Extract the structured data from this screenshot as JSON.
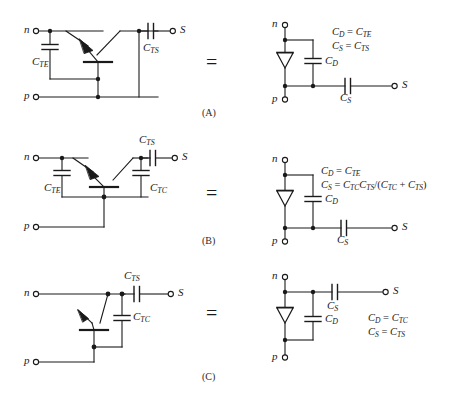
{
  "figure": {
    "background": "#ffffff",
    "ink": "#1a1a1a",
    "equals_sign": "=",
    "panels": [
      {
        "id": "A",
        "panel_label": "(A)",
        "left_circuit": {
          "terminals": [
            {
              "name": "n",
              "label": "n"
            },
            {
              "name": "p",
              "label": "p"
            },
            {
              "name": "S",
              "label": "S"
            }
          ],
          "capacitors": [
            {
              "name": "C_TE",
              "base": "C",
              "sub": "TE"
            },
            {
              "name": "C_TS",
              "base": "C",
              "sub": "TS"
            }
          ],
          "device": "bipolar-transistor"
        },
        "right_circuit": {
          "terminals": [
            {
              "name": "n",
              "label": "n"
            },
            {
              "name": "p",
              "label": "p"
            },
            {
              "name": "S",
              "label": "S"
            }
          ],
          "capacitors": [
            {
              "name": "C_D",
              "base": "C",
              "sub": "D"
            },
            {
              "name": "C_S",
              "base": "C",
              "sub": "S"
            }
          ],
          "device": "diode"
        },
        "equations": [
          {
            "lhs_base": "C",
            "lhs_sub": "D",
            "op": "=",
            "rhs": "C",
            "rhs_sub": "TE",
            "text": "C_D = C_TE"
          },
          {
            "lhs_base": "C",
            "lhs_sub": "S",
            "op": "=",
            "rhs": "C",
            "rhs_sub": "TS",
            "text": "C_S = C_TS"
          }
        ]
      },
      {
        "id": "B",
        "panel_label": "(B)",
        "left_circuit": {
          "terminals": [
            {
              "name": "n",
              "label": "n"
            },
            {
              "name": "p",
              "label": "p"
            },
            {
              "name": "S",
              "label": "S"
            }
          ],
          "capacitors": [
            {
              "name": "C_TE",
              "base": "C",
              "sub": "TE"
            },
            {
              "name": "C_TC",
              "base": "C",
              "sub": "TC"
            },
            {
              "name": "C_TS",
              "base": "C",
              "sub": "TS"
            }
          ],
          "device": "bipolar-transistor"
        },
        "right_circuit": {
          "terminals": [
            {
              "name": "n",
              "label": "n"
            },
            {
              "name": "p",
              "label": "p"
            },
            {
              "name": "S",
              "label": "S"
            }
          ],
          "capacitors": [
            {
              "name": "C_D",
              "base": "C",
              "sub": "D"
            },
            {
              "name": "C_S",
              "base": "C",
              "sub": "S"
            }
          ],
          "device": "diode"
        },
        "equations": [
          {
            "text": "C_D = C_TE"
          },
          {
            "text": "C_S = C_TC C_TS /(C_TC + C_TS)"
          }
        ]
      },
      {
        "id": "C",
        "panel_label": "(C)",
        "left_circuit": {
          "terminals": [
            {
              "name": "n",
              "label": "n"
            },
            {
              "name": "p",
              "label": "p"
            },
            {
              "name": "S",
              "label": "S"
            }
          ],
          "capacitors": [
            {
              "name": "C_TS",
              "base": "C",
              "sub": "TS"
            },
            {
              "name": "C_TC",
              "base": "C",
              "sub": "TC"
            }
          ],
          "device": "bipolar-transistor"
        },
        "right_circuit": {
          "terminals": [
            {
              "name": "n",
              "label": "n"
            },
            {
              "name": "p",
              "label": "p"
            },
            {
              "name": "S",
              "label": "S"
            }
          ],
          "capacitors": [
            {
              "name": "C_S",
              "base": "C",
              "sub": "S"
            },
            {
              "name": "C_D",
              "base": "C",
              "sub": "D"
            }
          ],
          "device": "diode"
        },
        "equations": [
          {
            "text": "C_D = C_TC"
          },
          {
            "text": "C_S = C_TS"
          }
        ]
      }
    ],
    "labels": {
      "n": "n",
      "p": "p",
      "S": "S",
      "C": "C",
      "sub_TE": "TE",
      "sub_TC": "TC",
      "sub_TS": "TS",
      "sub_D": "D",
      "sub_S": "S",
      "eq": "=",
      "plus": "+",
      "slash": "/",
      "paren_open": "(",
      "paren_close": ")",
      "panel_a": "(A)",
      "panel_b": "(B)",
      "panel_c": "(C)"
    },
    "bottom_caption_fragment": ""
  }
}
